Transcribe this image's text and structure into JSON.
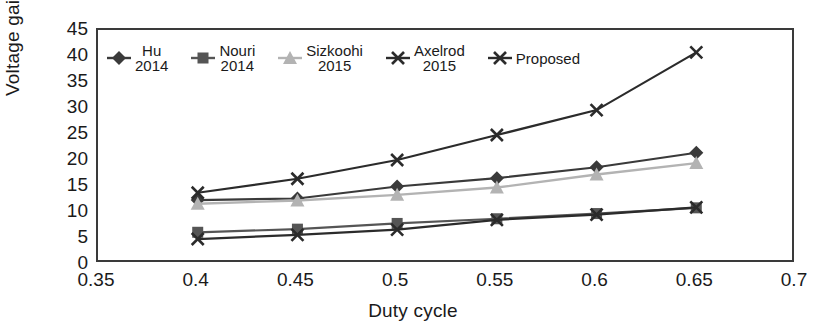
{
  "chart_data": {
    "type": "line",
    "title": "",
    "xlabel": "Duty cycle",
    "ylabel": "Voltage gain",
    "xlim": [
      0.35,
      0.7
    ],
    "ylim": [
      0,
      45
    ],
    "xticks": [
      "0.35",
      "0.4",
      "0.45",
      "0.5",
      "0.55",
      "0.6",
      "0.65",
      "0.7"
    ],
    "yticks": [
      "0",
      "5",
      "10",
      "15",
      "20",
      "25",
      "30",
      "35",
      "40",
      "45"
    ],
    "grid": false,
    "legend_position": "top-left-inside",
    "x": [
      0.4,
      0.45,
      0.5,
      0.55,
      0.6,
      0.65
    ],
    "series": [
      {
        "name": "Hu 2014",
        "label_line1": "Hu",
        "label_line2": "2014",
        "marker": "diamond",
        "color": "#3a3a3a",
        "values": [
          12.3,
          12.6,
          14.9,
          16.5,
          18.6,
          21.4
        ]
      },
      {
        "name": "Nouri 2014",
        "label_line1": "Nouri",
        "label_line2": "2014",
        "marker": "square",
        "color": "#555555",
        "values": [
          6.1,
          6.7,
          7.8,
          8.7,
          9.7,
          10.8
        ]
      },
      {
        "name": "Sizkoohi 2015",
        "label_line1": "Sizkoohi",
        "label_line2": "2015",
        "marker": "triangle",
        "color": "#b3b3b3",
        "values": [
          11.6,
          12.2,
          13.3,
          14.7,
          17.2,
          19.4
        ]
      },
      {
        "name": "Axelrod 2015",
        "label_line1": "Axelrod",
        "label_line2": "2015",
        "marker": "cross",
        "color": "#2b2b2b",
        "values": [
          4.8,
          5.6,
          6.6,
          8.5,
          9.5,
          10.9
        ]
      },
      {
        "name": "Proposed",
        "label_line1": "Proposed",
        "label_line2": "",
        "marker": "cross",
        "color": "#2b2b2b",
        "values": [
          13.7,
          16.4,
          20.0,
          24.8,
          29.6,
          40.7
        ]
      }
    ]
  }
}
